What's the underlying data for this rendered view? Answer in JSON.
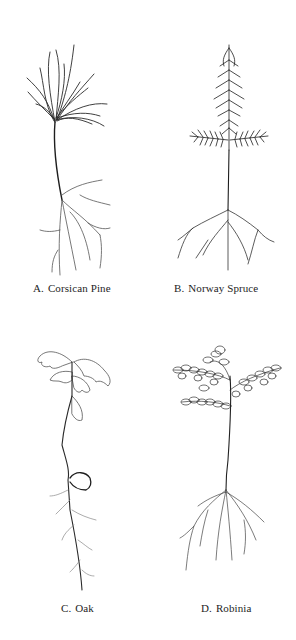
{
  "figure": {
    "panels": [
      {
        "id": "A",
        "letter": "A.",
        "name": "Corsican Pine",
        "illustration": "corsican-pine-seedling"
      },
      {
        "id": "B",
        "letter": "B.",
        "name": "Norway Spruce",
        "illustration": "norway-spruce-seedling"
      },
      {
        "id": "C",
        "letter": "C.",
        "name": "Oak",
        "illustration": "oak-seedling"
      },
      {
        "id": "D",
        "letter": "D.",
        "name": "Robinia",
        "illustration": "robinia-seedling"
      }
    ],
    "colors": {
      "ink": "#1e1e1e",
      "light_ink": "#6a6a6a",
      "background": "#ffffff"
    }
  }
}
